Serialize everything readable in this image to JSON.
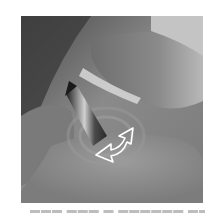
{
  "image": {
    "description": "Grayscale close-up photo of fingers pinching and rotating a small cylindrical object, with a white outlined curved arrow indicating rotation direction",
    "colors": {
      "background": "#ffffff",
      "photo_dark": "#3a3a3a",
      "photo_mid": "#8c8c8c",
      "photo_light": "#c8c8c8",
      "arrow_outline": "#ffffff"
    },
    "arrow": {
      "icon": "curved-rotate-arrow-icon",
      "direction": "counter-clockwise"
    }
  },
  "caption": {
    "text": "▬▬▬ ▬▬▬ ▬ ▬▬▬▬▬▬ ▬▬▬ ▬▬▬",
    "legible": false
  }
}
